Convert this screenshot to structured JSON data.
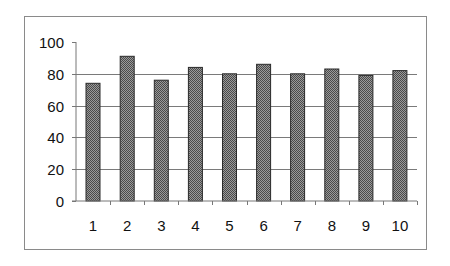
{
  "chart_data": {
    "type": "bar",
    "title": "",
    "xlabel": "",
    "ylabel": "",
    "categories": [
      "1",
      "2",
      "3",
      "4",
      "5",
      "6",
      "7",
      "8",
      "9",
      "10"
    ],
    "values": [
      74,
      91,
      76,
      84,
      80,
      86,
      80,
      83,
      79,
      82
    ],
    "ylim": [
      0,
      100
    ],
    "yticks": [
      "0",
      "20",
      "40",
      "60",
      "80",
      "100"
    ],
    "grid": "horizontal",
    "legend": "none",
    "bar_style": {
      "fill": "checkered gray hatch",
      "fill_dark": "#4a4a4a",
      "fill_light": "#9a9a9a",
      "stroke": "#2a2a2a"
    }
  }
}
